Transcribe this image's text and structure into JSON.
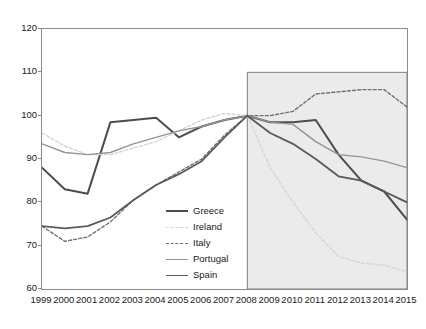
{
  "chart_data": {
    "type": "line",
    "title": "",
    "subtitle": "",
    "xlabel": "",
    "ylabel": "",
    "x": [
      1999,
      2000,
      2001,
      2002,
      2003,
      2004,
      2005,
      2006,
      2007,
      2008,
      2009,
      2010,
      2011,
      2012,
      2013,
      2014,
      2015
    ],
    "xlim": [
      1999,
      2015
    ],
    "ylim": [
      60,
      120
    ],
    "yticks": [
      60,
      70,
      80,
      90,
      100,
      110,
      120
    ],
    "xticks": [
      "1999",
      "2000",
      "2001",
      "2002",
      "2003",
      "2004",
      "2005",
      "2006",
      "2007",
      "2008",
      "2009",
      "2010",
      "2011",
      "2012",
      "2013",
      "2014",
      "2015"
    ],
    "grid": false,
    "legend_position": "inside-lower-center",
    "shaded_region": {
      "from": 2008,
      "to": 2015,
      "color": "#ebebeb",
      "border": "#7d7d7d"
    },
    "series": [
      {
        "name": "Greece",
        "color": "#4d4d4d",
        "style": "solid",
        "width": 2.0,
        "values": [
          88.0,
          83.0,
          82.0,
          98.5,
          99.0,
          99.5,
          95.0,
          97.5,
          99.0,
          100.0,
          98.5,
          98.5,
          99.0,
          91.0,
          85.0,
          82.5,
          76.0
        ]
      },
      {
        "name": "Ireland",
        "color": "#d5d5d5",
        "style": "dashed",
        "width": 1.4,
        "values": [
          96.0,
          93.0,
          91.0,
          91.0,
          92.5,
          94.0,
          96.5,
          99.0,
          100.5,
          100.0,
          88.0,
          80.0,
          73.0,
          67.5,
          66.0,
          65.5,
          64.0
        ]
      },
      {
        "name": "Italy",
        "color": "#707070",
        "style": "dashed",
        "width": 1.4,
        "values": [
          74.5,
          71.0,
          72.0,
          75.5,
          80.5,
          84.0,
          87.0,
          90.0,
          95.5,
          100.0,
          100.0,
          101.0,
          105.0,
          105.5,
          106.0,
          106.0,
          102.0
        ]
      },
      {
        "name": "Portugal",
        "color": "#949494",
        "style": "solid",
        "width": 1.4,
        "values": [
          93.5,
          91.5,
          91.0,
          91.5,
          93.5,
          95.0,
          96.5,
          97.5,
          99.0,
          100.0,
          98.5,
          98.0,
          94.0,
          91.0,
          90.5,
          89.5,
          88.0
        ]
      },
      {
        "name": "Spain",
        "color": "#5a5a5a",
        "style": "solid",
        "width": 1.8,
        "values": [
          74.5,
          74.0,
          74.5,
          76.5,
          80.5,
          84.0,
          86.5,
          89.5,
          95.0,
          100.0,
          96.0,
          93.5,
          90.0,
          86.0,
          85.0,
          82.5,
          80.0
        ]
      }
    ]
  },
  "legend": {
    "entries": [
      {
        "label": "Greece"
      },
      {
        "label": "Ireland"
      },
      {
        "label": "Italy"
      },
      {
        "label": "Portugal"
      },
      {
        "label": "Spain"
      }
    ]
  }
}
